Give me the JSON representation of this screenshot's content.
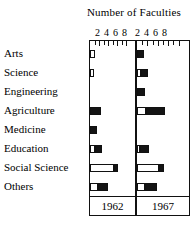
{
  "chart_data": {
    "type": "bar",
    "title": "Number of Faculties",
    "xlabel": "",
    "ylabel": "",
    "orientation": "horizontal",
    "grid": false,
    "legend_position": "none",
    "xlim": [
      0,
      10
    ],
    "tick_values": [
      2,
      4,
      6,
      8
    ],
    "tick_labels": [
      "2",
      "4",
      "6",
      "8"
    ],
    "categories": [
      "Arts",
      "Science",
      "Engineering",
      "Agriculture",
      "Medicine",
      "Education",
      "Social Science",
      "Others"
    ],
    "panels": [
      {
        "name": "1962",
        "label": "1962",
        "stacked_segments": [
          "open",
          "solid"
        ],
        "series": [
          {
            "name": "open",
            "values": [
              1.2,
              0.9,
              0.0,
              0.0,
              0.0,
              1.2,
              5.4,
              1.8
            ]
          },
          {
            "name": "solid",
            "values": [
              0.0,
              0.0,
              0.0,
              2.4,
              1.5,
              1.5,
              0.8,
              2.2
            ]
          }
        ],
        "totals": [
          1.2,
          0.9,
          0.0,
          2.4,
          1.5,
          2.7,
          6.2,
          4.0
        ]
      },
      {
        "name": "1967",
        "label": "1967",
        "stacked_segments": [
          "open",
          "solid"
        ],
        "series": [
          {
            "name": "open",
            "values": [
              0.0,
              0.8,
              0.0,
              1.8,
              0.0,
              0.5,
              4.2,
              1.6
            ]
          },
          {
            "name": "solid",
            "values": [
              1.4,
              1.3,
              1.5,
              3.6,
              0.0,
              1.8,
              1.0,
              2.2
            ]
          }
        ],
        "totals": [
          1.4,
          2.1,
          1.5,
          5.4,
          0.0,
          2.3,
          5.2,
          3.8
        ]
      }
    ]
  },
  "colors": {
    "solid": "#141414",
    "open": "#ffffff",
    "line": "#111111",
    "background": "#ffffff"
  },
  "axis": {
    "left_numbers": [
      "2",
      "4",
      "6",
      "8"
    ],
    "right_numbers": [
      "2",
      "4",
      "6",
      "8"
    ]
  },
  "footer": {
    "left_year": "1962",
    "right_year": "1967"
  }
}
